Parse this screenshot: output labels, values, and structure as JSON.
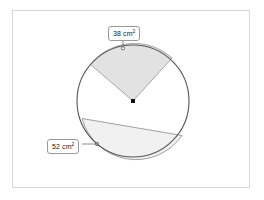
{
  "page": {
    "background_color": "#ffffff",
    "frame_border_color": "#d8d8d8"
  },
  "diagram": {
    "type": "circle-geometry",
    "circle": {
      "center_x": 133,
      "center_y": 101,
      "radius": 56,
      "stroke_color": "#555555",
      "fill_color": "#ffffff"
    },
    "center_marker": {
      "shape": "square",
      "color": "#111111",
      "size": 4
    },
    "regions": [
      {
        "id": "sector",
        "kind": "sector",
        "label": "38 cm",
        "unit_exponent": "2",
        "fill_color": "#e2e2e2",
        "stroke_color": "#7a7a7a",
        "marker_x": 123,
        "marker_y": 48,
        "marker_shape": "open-circle"
      },
      {
        "id": "segment",
        "kind": "segment",
        "label": "52 cm",
        "unit_exponent": "2",
        "fill_color": "#f1f1f1",
        "stroke_color": "#7a7a7a",
        "marker_x": 97,
        "marker_y": 144,
        "marker_shape": "filled-circle"
      }
    ],
    "leader_line_color": "#6e6e6e"
  },
  "labels": {
    "sector_area": "38 cm",
    "sector_area_exponent": "2",
    "segment_area": "52 cm",
    "segment_area_exponent": "2"
  }
}
